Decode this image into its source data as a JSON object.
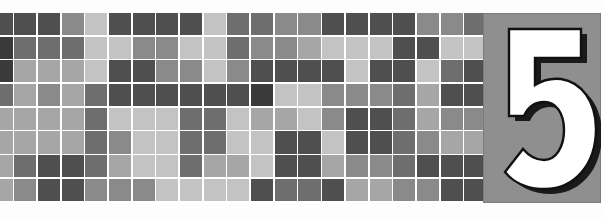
{
  "page": {
    "kind": "book-chapter-opener-banner",
    "background_color": "#fefefe"
  },
  "banner": {
    "name": "chapter-banner",
    "top": 13,
    "height": 190
  },
  "numeral": {
    "label": "5",
    "aria_label": "Chapter number 5",
    "fill_color": "#ffffff",
    "shadow_color": "#1a1a1a",
    "panel_color": "#8f8f8f",
    "panel_edge_color": "#7c7c7c"
  },
  "mosaic": {
    "name": "grayscale-mosaic-grid",
    "columns": 22,
    "rows": 8,
    "cell_size": 22.1,
    "gap": 1.6,
    "gap_color": "#ffffff",
    "palette": {
      "0": "#e2e2e2",
      "1": "#c3c3c3",
      "2": "#a6a6a6",
      "3": "#8a8a8a",
      "4": "#6e6e6e",
      "5": "#4f4f4f",
      "6": "#3a3a3a"
    },
    "grid": [
      [
        5,
        5,
        5,
        3,
        1,
        5,
        5,
        5,
        5,
        1,
        4,
        4,
        3,
        3,
        5,
        5,
        5,
        5,
        3,
        3,
        4,
        4
      ],
      [
        6,
        4,
        4,
        4,
        1,
        1,
        3,
        3,
        1,
        1,
        4,
        3,
        3,
        2,
        1,
        1,
        1,
        5,
        5,
        1,
        1,
        3
      ],
      [
        6,
        2,
        2,
        2,
        1,
        5,
        5,
        3,
        3,
        1,
        3,
        5,
        5,
        5,
        5,
        1,
        5,
        5,
        1,
        4,
        5,
        5
      ],
      [
        4,
        2,
        3,
        2,
        4,
        5,
        5,
        5,
        5,
        5,
        5,
        6,
        1,
        1,
        3,
        3,
        3,
        4,
        2,
        5,
        5,
        4
      ],
      [
        2,
        2,
        2,
        2,
        4,
        1,
        1,
        1,
        4,
        4,
        1,
        2,
        2,
        1,
        3,
        5,
        5,
        4,
        2,
        3,
        3,
        2
      ],
      [
        2,
        2,
        2,
        2,
        4,
        3,
        1,
        1,
        4,
        4,
        1,
        1,
        5,
        5,
        1,
        5,
        5,
        4,
        3,
        2,
        2,
        1
      ],
      [
        2,
        4,
        5,
        5,
        4,
        2,
        1,
        1,
        4,
        2,
        2,
        1,
        5,
        5,
        2,
        3,
        3,
        4,
        5,
        5,
        5,
        1
      ],
      [
        2,
        3,
        5,
        5,
        3,
        3,
        3,
        1,
        1,
        1,
        1,
        5,
        4,
        4,
        5,
        2,
        2,
        3,
        3,
        5,
        5,
        2
      ]
    ]
  }
}
